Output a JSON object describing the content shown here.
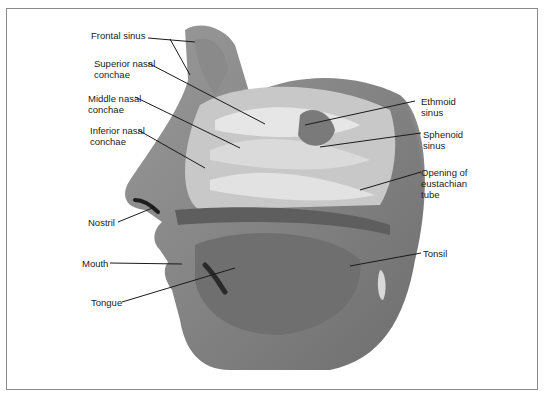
{
  "figure": {
    "labels": {
      "frontal_sinus": "Frontal sinus",
      "superior_nasal_conchae": "Superior nasal\nconchae",
      "middle_nasal_conchae": "Middle nasal\nconchae",
      "inferior_nasal_conchae": "Inferior nasal\nconchae",
      "nostril": "Nostril",
      "mouth": "Mouth",
      "tongue": "Tongue",
      "ethmoid_sinus": "Ethmoid\nsinus",
      "sphenoid_sinus": "Sphenoid\nsinus",
      "opening_eustachian_tube": "Opening of\neustachian\ntube",
      "tonsil": "Tonsil"
    }
  }
}
